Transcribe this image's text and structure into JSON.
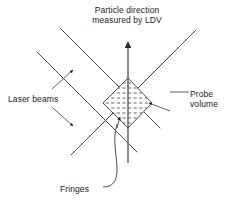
{
  "figure": {
    "type": "diagram",
    "background_color": "#ffffff",
    "stroke_color": "#333333",
    "text_color": "#1a1a1a"
  },
  "labels": {
    "title_line1": "Particle direction",
    "title_line2": "measured by LDV",
    "laser_beams": "Laser beams",
    "probe_volume_line1": "Probe",
    "probe_volume_line2": "volume",
    "fringes": "Fringes"
  },
  "geometry": {
    "probe_volume": {
      "shape": "diamond",
      "top": [
        128,
        78
      ],
      "right": [
        152,
        103
      ],
      "bottom": [
        128,
        128
      ],
      "left": [
        103,
        103
      ],
      "fill": "fringe-stripes",
      "fringe_count": 9
    },
    "particle_arrow": {
      "from": [
        128,
        163
      ],
      "to": [
        128,
        40
      ],
      "direction": "up"
    },
    "beams": [
      {
        "name": "beam-upper-left",
        "from": [
          60,
          28
        ],
        "to": [
          160,
          128
        ]
      },
      {
        "name": "beam-lower-left",
        "from": [
          37,
          52
        ],
        "to": [
          137,
          152
        ]
      },
      {
        "name": "beam-upper-right",
        "from": [
          196,
          30
        ],
        "to": [
          96,
          130
        ]
      },
      {
        "name": "beam-lower-right",
        "from": [
          171,
          55
        ],
        "to": [
          71,
          155
        ]
      }
    ],
    "laser_beam_arrows": [
      {
        "name": "laser-arrow-up",
        "from": [
          52,
          88
        ],
        "to": [
          72,
          70
        ]
      },
      {
        "name": "laser-arrow-down",
        "from": [
          52,
          107
        ],
        "to": [
          72,
          125
        ]
      }
    ],
    "probe_volume_leader": {
      "line": [
        [
          188,
          92
        ],
        [
          168,
          92
        ]
      ],
      "arrow_to": [
        147,
        104
      ]
    },
    "fringes_leader": {
      "arrow_to": [
        118,
        118
      ],
      "curve": "from (104,186) right then curving up to (118,118)"
    }
  }
}
